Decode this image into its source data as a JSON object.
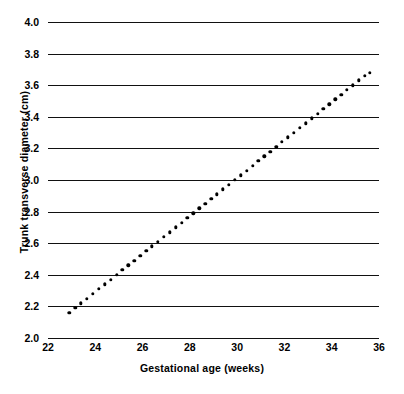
{
  "chart_data": {
    "type": "scatter",
    "title": "",
    "xlabel": "Gestational age (weeks)",
    "ylabel": "Trunk transverse diameter (cm)",
    "xlim": [
      22,
      36
    ],
    "ylim": [
      2.0,
      4.0
    ],
    "xticks": [
      22,
      24,
      26,
      28,
      30,
      32,
      34,
      36
    ],
    "yticks": [
      2.0,
      2.2,
      2.4,
      2.6,
      2.8,
      3.0,
      3.2,
      3.4,
      3.6,
      3.8,
      4.0
    ],
    "xtick_labels": [
      "22",
      "24",
      "26",
      "28",
      "30",
      "32",
      "34",
      "36"
    ],
    "ytick_labels": [
      "2.0",
      "2.2",
      "2.4",
      "2.6",
      "2.8",
      "3.0",
      "3.2",
      "3.4",
      "3.6",
      "3.8",
      "4.0"
    ],
    "grid": "horizontal",
    "legend": "none",
    "series": [
      {
        "name": "Trunk transverse diameter",
        "marker": "dot",
        "color": "#000000",
        "x": [
          22.9,
          23.15,
          23.4,
          23.65,
          23.9,
          24.15,
          24.4,
          24.65,
          24.9,
          25.15,
          25.4,
          25.65,
          25.9,
          26.15,
          26.4,
          26.65,
          26.9,
          27.15,
          27.4,
          27.65,
          27.9,
          28.15,
          28.4,
          28.65,
          28.9,
          29.15,
          29.4,
          29.65,
          29.9,
          30.15,
          30.4,
          30.65,
          30.9,
          31.15,
          31.4,
          31.65,
          31.9,
          32.15,
          32.4,
          32.65,
          32.9,
          33.15,
          33.4,
          33.65,
          33.9,
          34.15,
          34.4,
          34.65,
          34.9,
          35.15,
          35.4,
          35.6
        ],
        "y": [
          2.16,
          2.19,
          2.22,
          2.25,
          2.28,
          2.31,
          2.34,
          2.37,
          2.4,
          2.43,
          2.46,
          2.49,
          2.52,
          2.55,
          2.58,
          2.61,
          2.64,
          2.67,
          2.7,
          2.73,
          2.76,
          2.79,
          2.82,
          2.85,
          2.88,
          2.91,
          2.94,
          2.97,
          3.0,
          3.03,
          3.06,
          3.09,
          3.12,
          3.15,
          3.18,
          3.21,
          3.24,
          3.27,
          3.3,
          3.33,
          3.36,
          3.39,
          3.42,
          3.45,
          3.48,
          3.51,
          3.54,
          3.57,
          3.6,
          3.63,
          3.66,
          3.68
        ]
      }
    ]
  },
  "axis": {
    "x_title": "Gestational age (weeks)",
    "y_title": "Trunk transverse diameter (cm)"
  },
  "colors": {
    "ink": "#111111",
    "marker": "#000000",
    "background": "#ffffff"
  }
}
